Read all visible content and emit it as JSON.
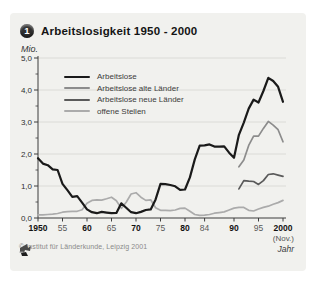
{
  "title": {
    "badge": "1",
    "text": "Arbeitslosigkeit 1950 - 2000"
  },
  "y_unit": "Mio.",
  "x_axis_note": "(Nov.)",
  "x_axis_label": "Jahr",
  "footer": {
    "copyright": "© Institut für Länderkunde, Leipzig 2001"
  },
  "colors": {
    "card_bg": "#f1f1ee",
    "grid": "#d9d9d4",
    "axis": "#3c3c3c",
    "series_black": "#1a1a1a",
    "series_gray_alte": "#8c8c8c",
    "series_gray_neue": "#5a5a5a",
    "series_gray_offene": "#ababab"
  },
  "chart_data": {
    "type": "line",
    "title": "Arbeitslosigkeit 1950 - 2000",
    "xlabel": "Jahr",
    "ylabel": "Mio.",
    "ylim": [
      0,
      5
    ],
    "xlim": [
      1950,
      2000
    ],
    "grid": "horizontal",
    "legend_position": "top-left-inside",
    "y_ticks": [
      {
        "label": "5,0",
        "value": 5
      },
      {
        "label": "4,0",
        "value": 4
      },
      {
        "label": "3,0",
        "value": 3
      },
      {
        "label": "2,0",
        "value": 2
      },
      {
        "label": "1,0",
        "value": 1
      },
      {
        "label": "0,0",
        "value": 0
      }
    ],
    "x_ticks": [
      {
        "label": "1950",
        "year": 1950,
        "bold": true
      },
      {
        "label": "55",
        "year": 1955,
        "bold": false
      },
      {
        "label": "60",
        "year": 1960,
        "bold": true
      },
      {
        "label": "65",
        "year": 1965,
        "bold": false
      },
      {
        "label": "70",
        "year": 1970,
        "bold": true
      },
      {
        "label": "75",
        "year": 1975,
        "bold": false
      },
      {
        "label": "80",
        "year": 1980,
        "bold": true
      },
      {
        "label": "84",
        "year": 1984,
        "bold": false
      },
      {
        "label": "90",
        "year": 1990,
        "bold": true
      },
      {
        "label": "95",
        "year": 1995,
        "bold": false
      },
      {
        "label": "2000",
        "year": 2000,
        "bold": true
      }
    ],
    "series": [
      {
        "name": "Arbeitslose",
        "color": "#1a1a1a",
        "width": 2.2,
        "x_start": 1950,
        "values": [
          1.87,
          1.7,
          1.65,
          1.52,
          1.5,
          1.07,
          0.87,
          0.66,
          0.68,
          0.48,
          0.27,
          0.18,
          0.15,
          0.19,
          0.17,
          0.15,
          0.16,
          0.46,
          0.32,
          0.18,
          0.15,
          0.19,
          0.25,
          0.27,
          0.58,
          1.07,
          1.06,
          1.03,
          0.99,
          0.88,
          0.89,
          1.27,
          1.83,
          2.26,
          2.27,
          2.3,
          2.23,
          2.23,
          2.24,
          2.04,
          1.88,
          2.6,
          2.98,
          3.42,
          3.7,
          3.61,
          3.97,
          4.38,
          4.28,
          4.1,
          3.63
        ]
      },
      {
        "name": "Arbeitslose alte Länder",
        "color": "#8c8c8c",
        "width": 1.7,
        "x_start": 1991,
        "values": [
          1.6,
          1.81,
          2.27,
          2.56,
          2.56,
          2.8,
          3.02,
          2.9,
          2.76,
          2.38
        ]
      },
      {
        "name": "Arbeitslose neue Länder",
        "color": "#5a5a5a",
        "width": 1.7,
        "x_start": 1991,
        "values": [
          0.91,
          1.17,
          1.15,
          1.14,
          1.05,
          1.17,
          1.36,
          1.38,
          1.34,
          1.3
        ]
      },
      {
        "name": "offene Stellen",
        "color": "#ababab",
        "width": 1.7,
        "x_start": 1950,
        "values": [
          0.1,
          0.1,
          0.11,
          0.12,
          0.14,
          0.18,
          0.2,
          0.21,
          0.21,
          0.26,
          0.46,
          0.55,
          0.57,
          0.56,
          0.6,
          0.65,
          0.54,
          0.3,
          0.49,
          0.75,
          0.79,
          0.65,
          0.55,
          0.57,
          0.32,
          0.24,
          0.24,
          0.23,
          0.25,
          0.3,
          0.31,
          0.21,
          0.11,
          0.08,
          0.09,
          0.11,
          0.15,
          0.17,
          0.19,
          0.25,
          0.31,
          0.33,
          0.33,
          0.24,
          0.22,
          0.28,
          0.33,
          0.37,
          0.43,
          0.48,
          0.55
        ]
      }
    ]
  }
}
